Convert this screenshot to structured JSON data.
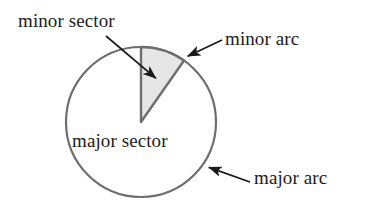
{
  "figure": {
    "background_color": "#ffffff"
  },
  "labels": {
    "minor_sector": "minor sector",
    "minor_arc": "minor arc",
    "major_sector": "major sector",
    "major_arc": "major arc"
  },
  "colors": {
    "stroke": "#6e6e6e",
    "sector_fill": "#e6e6e6",
    "sector_edge": "#6e6e6e",
    "text": "#1c1c1c",
    "arrow": "#1a1a1a"
  },
  "geometry": {
    "circle": {
      "center_x": 141,
      "center_y": 122,
      "radius": 75,
      "stroke_width": 2.2
    },
    "minor_sector": {
      "start_angle_deg": 90,
      "end_angle_deg": 55,
      "sweep_deg": 35,
      "description": "shaded wedge from 12 o'clock to about 2 o'clock"
    },
    "major_sector": {
      "sweep_deg": 325,
      "description": "unshaded remainder of the disc"
    }
  },
  "annotations": [
    {
      "name": "minor-sector-pointer",
      "label": "minor sector",
      "from_x": 106,
      "from_y": 36,
      "to_x": 159,
      "to_y": 81
    },
    {
      "name": "minor-arc-pointer",
      "label": "minor arc",
      "from_x": 222,
      "from_y": 40,
      "to_x": 184,
      "to_y": 58
    },
    {
      "name": "major-arc-pointer",
      "label": "major arc",
      "from_x": 250,
      "from_y": 182,
      "to_x": 205,
      "to_y": 166
    }
  ]
}
